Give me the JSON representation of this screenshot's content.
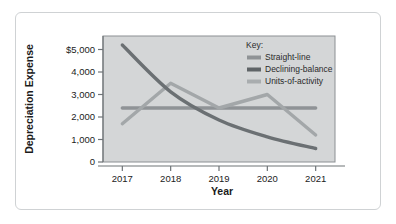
{
  "chart_data": {
    "type": "line",
    "title": "",
    "xlabel": "Year",
    "ylabel": "Depreciation Expense",
    "categories": [
      "2017",
      "2018",
      "2019",
      "2020",
      "2021"
    ],
    "x": [
      2017,
      2018,
      2019,
      2020,
      2021
    ],
    "xlim": [
      2016.6,
      2021.4
    ],
    "ylim": [
      0,
      5600
    ],
    "grid": false,
    "legend_position": "top-right",
    "legend_title": "Key:",
    "y_ticks": [
      0,
      1000,
      2000,
      3000,
      4000,
      5000
    ],
    "y_tick_labels": [
      "0",
      "1,000",
      "2,000",
      "3,000",
      "4,000",
      "$5,000"
    ],
    "x_tick_labels": [
      "2017",
      "2018",
      "2019",
      "2020",
      "2021"
    ],
    "series": [
      {
        "name": "Straight-line",
        "color": "#8f9396",
        "values": [
          2400,
          2400,
          2400,
          2400,
          2400
        ]
      },
      {
        "name": "Declining-balance",
        "color": "#6b7073",
        "values": [
          5200,
          3120,
          1870,
          1120,
          600
        ]
      },
      {
        "name": "Units-of-activity",
        "color": "#a3a7a9",
        "values": [
          1700,
          3500,
          2400,
          3000,
          1200
        ]
      }
    ],
    "plot_background": "#d4d6d7",
    "plot_border": "#8c9093"
  },
  "figure": {
    "frame_border_color": "#cfd2d4",
    "background": "#ffffff"
  },
  "legend": {
    "heading": "Key:",
    "entries": [
      {
        "label": "Straight-line",
        "swatch": "#8f9396"
      },
      {
        "label": "Declining-balance",
        "swatch": "#5f6467"
      },
      {
        "label": "Units-of-activity",
        "swatch": "#a9adaf"
      }
    ]
  }
}
